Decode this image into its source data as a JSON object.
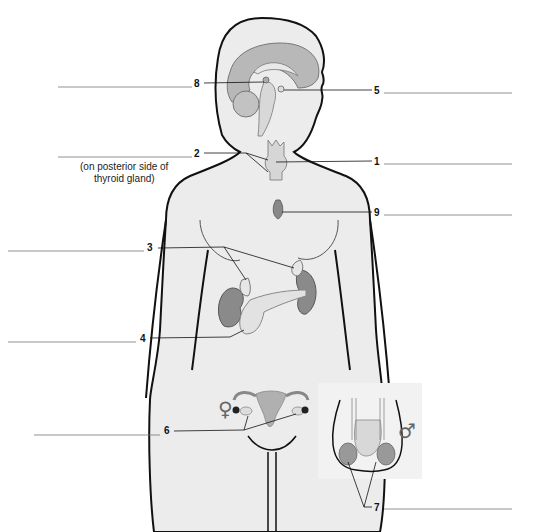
{
  "diagram": {
    "labels": [
      {
        "number": "1",
        "structure": "thyroid gland",
        "side": "right"
      },
      {
        "number": "2",
        "structure": "parathyroid glands",
        "side": "left",
        "note": "(on posterior side of thyroid gland)"
      },
      {
        "number": "3",
        "structure": "adrenal glands",
        "side": "left"
      },
      {
        "number": "4",
        "structure": "pancreas",
        "side": "left"
      },
      {
        "number": "5",
        "structure": "pituitary gland",
        "side": "right"
      },
      {
        "number": "6",
        "structure": "ovaries",
        "side": "left"
      },
      {
        "number": "7",
        "structure": "testes",
        "side": "right"
      },
      {
        "number": "8",
        "structure": "pineal gland",
        "side": "left"
      },
      {
        "number": "9",
        "structure": "thymus",
        "side": "right"
      }
    ],
    "note_line1": "(on posterior side of",
    "note_line2": "thyroid gland)",
    "female_symbol": "♀",
    "male_symbol": "♂",
    "colors": {
      "body_fill": "#ececec",
      "outline": "#111111",
      "gland_light": "#d6d6d6",
      "brain_fill": "#b8b8b8",
      "kidney_fill": "#8a8a8a",
      "answer_line": "#777777"
    }
  }
}
